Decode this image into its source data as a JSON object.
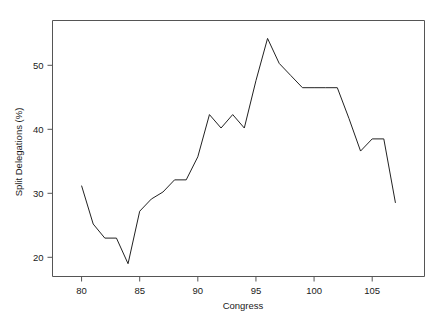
{
  "chart_data": {
    "type": "line",
    "title": "",
    "subtitle": "",
    "xlabel": "Congress",
    "ylabel": "Split Delegations (%)",
    "xlim": [
      77.5,
      109.5
    ],
    "ylim": [
      17.0,
      57.0
    ],
    "xticks": [
      80,
      85,
      90,
      95,
      100,
      105
    ],
    "yticks": [
      20,
      30,
      40,
      50
    ],
    "xtick_labels": [
      "80",
      "85",
      "90",
      "95",
      "100",
      "105"
    ],
    "ytick_labels": [
      "20",
      "30",
      "40",
      "50"
    ],
    "grid": false,
    "legend": null,
    "legend_position": "none",
    "line_color": "#222222",
    "axis_color": "#555555",
    "background_color": "#ffffff",
    "x": [
      80,
      81,
      82,
      83,
      84,
      85,
      86,
      87,
      88,
      89,
      90,
      91,
      92,
      93,
      94,
      95,
      96,
      97,
      98,
      99,
      100,
      101,
      102,
      103,
      104,
      105,
      106,
      107
    ],
    "values": [
      31.2,
      25.2,
      23.0,
      23.0,
      19.0,
      27.2,
      29.1,
      30.2,
      32.1,
      32.1,
      35.7,
      42.3,
      40.2,
      42.3,
      40.2,
      47.6,
      54.2,
      50.3,
      48.4,
      46.5,
      46.5,
      46.5,
      46.5,
      41.7,
      36.6,
      38.5,
      38.5,
      28.5
    ],
    "series": [
      {
        "name": "Split Delegations",
        "values": [
          31.2,
          25.2,
          23.0,
          23.0,
          19.0,
          27.2,
          29.1,
          30.2,
          32.1,
          32.1,
          35.7,
          42.3,
          40.2,
          42.3,
          40.2,
          47.6,
          54.2,
          50.3,
          48.4,
          46.5,
          46.5,
          46.5,
          46.5,
          41.7,
          36.6,
          38.5,
          38.5,
          28.5
        ]
      }
    ]
  }
}
